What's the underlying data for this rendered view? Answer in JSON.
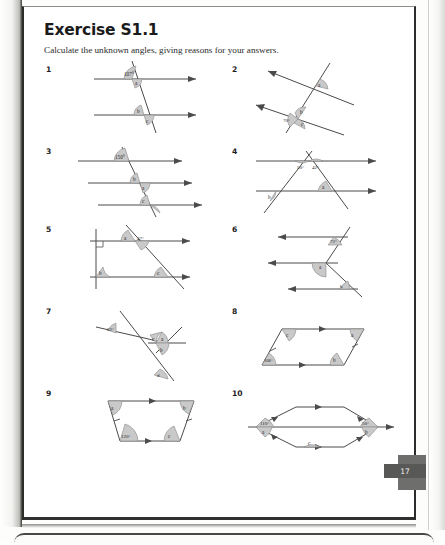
{
  "header": {
    "title": "Exercise S1.1",
    "instruction": "Calculate the unknown angles, giving reasons for your answers."
  },
  "page_number": "17",
  "questions": [
    {
      "number": "1",
      "description": "Two parallel horizontal lines cut by a transversal",
      "labels": [
        "107°",
        "a",
        "b",
        "c"
      ]
    },
    {
      "number": "2",
      "description": "Two parallel slanted lines cut by a transversal",
      "labels": [
        "70°",
        "a",
        "b",
        "c",
        "d"
      ]
    },
    {
      "number": "3",
      "description": "Three parallel horizontal lines cut by a transversal",
      "labels": [
        "150°",
        "a",
        "b",
        "c",
        "d"
      ]
    },
    {
      "number": "4",
      "description": "Two parallel lines with triangle formed by two transversals",
      "labels": [
        "50°",
        "42°",
        "a",
        "b"
      ]
    },
    {
      "number": "5",
      "description": "Two parallel lines with vertical line and slanted transversal, right angle marked",
      "labels": [
        "47°",
        "a",
        "b",
        "c"
      ]
    },
    {
      "number": "6",
      "description": "Zigzag between three parallel arrows",
      "labels": [
        "72°",
        "a",
        "b"
      ]
    },
    {
      "number": "7",
      "description": "Two crossing transversals over a slanted line",
      "labels": [
        "62°",
        "a",
        "b",
        "c",
        "d"
      ]
    },
    {
      "number": "8",
      "description": "Parallelogram with marked parallel sides",
      "labels": [
        "108°",
        "a",
        "b",
        "c"
      ]
    },
    {
      "number": "9",
      "description": "Trapezium with one pair of parallel sides",
      "labels": [
        "120°",
        "a",
        "b",
        "c"
      ]
    },
    {
      "number": "10",
      "description": "Rhombus with horizontal diagonal",
      "labels": [
        "110°",
        "50°",
        "a",
        "b",
        "c"
      ]
    }
  ],
  "style": {
    "line_color": "#4b4b4b",
    "arc_fill": "#c9c9c9",
    "arc_stroke": "#7d7d7d",
    "label_color": "#1f1f1f"
  }
}
